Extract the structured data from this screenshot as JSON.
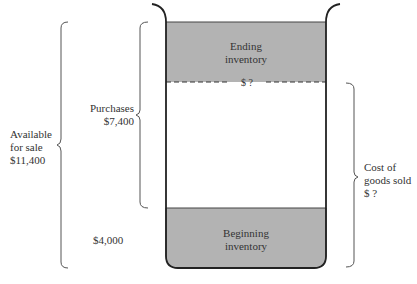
{
  "diagram": {
    "type": "inventory-container-flow",
    "container": {
      "ending_inventory": {
        "line1": "Ending",
        "line2": "inventory"
      },
      "beginning_inventory": {
        "line1": "Beginning",
        "line2": "inventory"
      },
      "ending_value": "$ ?"
    },
    "braces": {
      "available": {
        "line1": "Available",
        "line2": "for sale",
        "line3": "$11,400"
      },
      "purchases": {
        "line1": "Purchases",
        "line2": "$7,400"
      },
      "beginning_value": "$4,000",
      "cogs": {
        "line1": "Cost of",
        "line2": "goods sold",
        "line3": "$ ?"
      }
    },
    "colors": {
      "fill": "#b3b3b3",
      "stroke": "#333333",
      "brace": "#555555"
    }
  }
}
